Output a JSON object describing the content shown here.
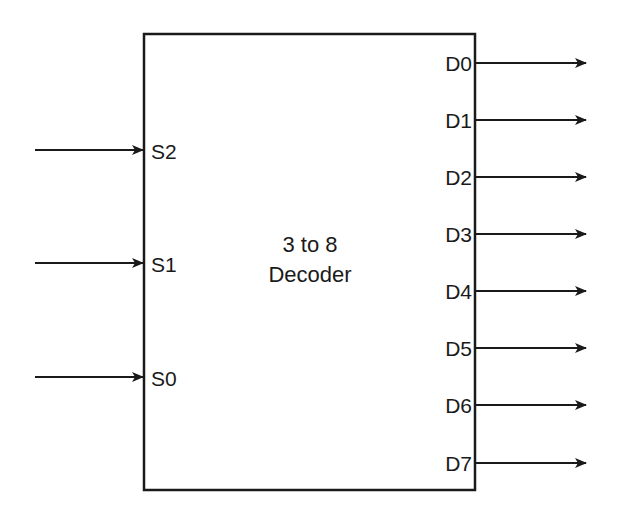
{
  "diagram": {
    "block": {
      "title_line1": "3 to 8",
      "title_line2": "Decoder"
    },
    "inputs": [
      {
        "label": "S2"
      },
      {
        "label": "S1"
      },
      {
        "label": "S0"
      }
    ],
    "outputs": [
      {
        "label": "D0"
      },
      {
        "label": "D1"
      },
      {
        "label": "D2"
      },
      {
        "label": "D3"
      },
      {
        "label": "D4"
      },
      {
        "label": "D5"
      },
      {
        "label": "D6"
      },
      {
        "label": "D7"
      }
    ],
    "colors": {
      "line": "#1a1a1a",
      "background": "#ffffff"
    }
  }
}
